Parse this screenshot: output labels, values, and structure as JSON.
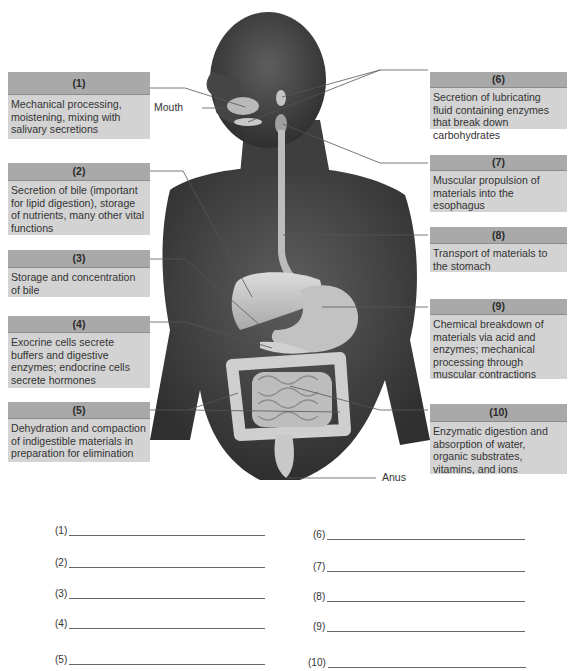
{
  "labels": {
    "mouth": "Mouth",
    "anus": "Anus"
  },
  "left_boxes": [
    {
      "number": "(1)",
      "description": "Mechanical processing, moistening, mixing with salivary secretions"
    },
    {
      "number": "(2)",
      "description": "Secretion of bile (important for lipid digestion), storage of nutrients, many other vital functions"
    },
    {
      "number": "(3)",
      "description": "Storage and concentration of bile"
    },
    {
      "number": "(4)",
      "description": "Exocrine cells secrete buffers and digestive enzymes; endocrine cells secrete hormones"
    },
    {
      "number": "(5)",
      "description": "Dehydration and compaction of indigestible materials in preparation for elimination"
    }
  ],
  "right_boxes": [
    {
      "number": "(6)",
      "description": "Secretion of lubricating fluid containing enzymes that break down carbohydrates"
    },
    {
      "number": "(7)",
      "description": "Muscular propulsion of materials into the esophagus"
    },
    {
      "number": "(8)",
      "description": "Transport of materials to the stomach"
    },
    {
      "number": "(9)",
      "description": "Chemical breakdown of materials via acid and enzymes; mechanical processing through muscular contractions"
    },
    {
      "number": "(10)",
      "description": "Enzymatic digestion and absorption of water, organic substrates, vitamins, and ions"
    }
  ],
  "answers_left": [
    {
      "number": "(1)",
      "value": ""
    },
    {
      "number": "(2)",
      "value": ""
    },
    {
      "number": "(3)",
      "value": ""
    },
    {
      "number": "(4)",
      "value": ""
    },
    {
      "number": "(5)",
      "value": ""
    }
  ],
  "answers_right": [
    {
      "number": "(6)",
      "value": ""
    },
    {
      "number": "(7)",
      "value": ""
    },
    {
      "number": "(8)",
      "value": ""
    },
    {
      "number": "(9)",
      "value": ""
    },
    {
      "number": "(10)",
      "value": ""
    }
  ],
  "colors": {
    "box_header": "#a9a9a9",
    "box_body": "#d3d3d3",
    "skin": "#4a4a4a",
    "organ": "#c8c8c8"
  }
}
